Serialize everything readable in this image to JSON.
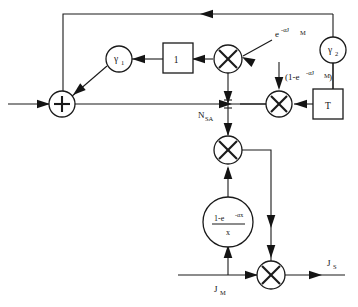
{
  "diagram": {
    "background_color": "#ffffff",
    "line_color": "#1a1a1a",
    "nodes": {
      "sum_junction": {
        "symbol": "+",
        "name": "summing-junction"
      },
      "gamma1": {
        "label": "γ",
        "subscript": "1"
      },
      "gain_one": {
        "label": "1"
      },
      "mult_top": {
        "symbol": "×"
      },
      "gamma2": {
        "label": "γ",
        "subscript": "2"
      },
      "mult_right": {
        "symbol": "×"
      },
      "delay_T": {
        "label": "T"
      },
      "mult_center": {
        "symbol": "×"
      },
      "transfer_circle": {
        "numerator": "1-e",
        "numerator_sup": "-αx",
        "denominator": "x"
      },
      "mult_bottom": {
        "symbol": "×"
      }
    },
    "labels": {
      "exp_term": {
        "base": "e",
        "superscript": "-αJ",
        "sup_subscript": "M"
      },
      "one_minus_exp_term": {
        "prefix": "(1-e",
        "superscript": "-αJ",
        "sup_subscript": "M",
        "suffix": ")"
      },
      "n_sa": {
        "base": "N",
        "subscript": "SA"
      },
      "j_m": {
        "base": "J",
        "subscript": "M"
      },
      "j_s": {
        "base": "J",
        "subscript": "S"
      }
    }
  }
}
